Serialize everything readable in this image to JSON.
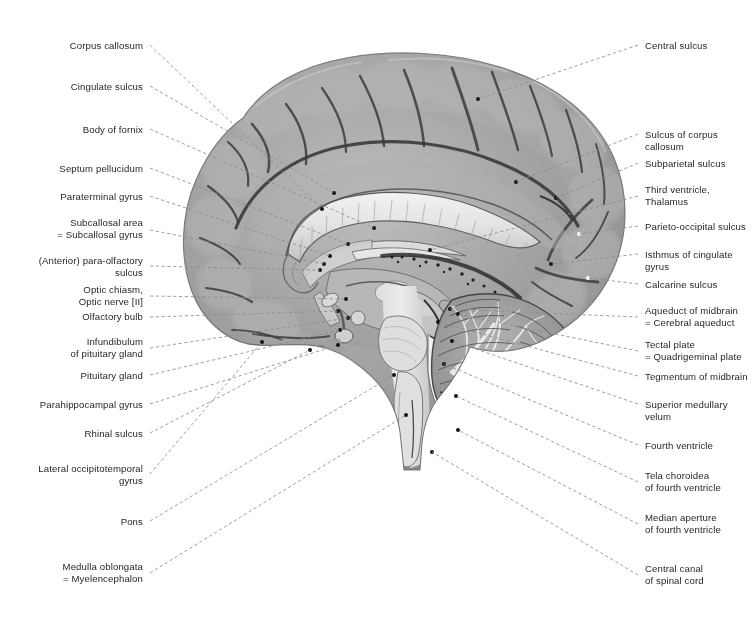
{
  "figure": {
    "background_color": "#ffffff",
    "leader_color": "#8d8d8d",
    "text_color": "#272727",
    "tissue_color": "#9a9a9a",
    "width": 752,
    "height": 643
  },
  "labels_left": [
    {
      "id": "corpus-callosum",
      "text": "Corpus callosum",
      "tx": 143,
      "ty": 47,
      "lx": 150,
      "ly": 45,
      "px": 322,
      "py": 209
    },
    {
      "id": "cingulate-sulcus",
      "text": "Cingulate sulcus",
      "tx": 143,
      "ty": 88,
      "lx": 150,
      "ly": 86,
      "px": 334,
      "py": 193
    },
    {
      "id": "body-of-fornix",
      "text": "Body of fornix",
      "tx": 143,
      "ty": 131,
      "lx": 150,
      "ly": 129,
      "px": 374,
      "py": 228
    },
    {
      "id": "septum-pellucidum",
      "text": "Septum pellucidum",
      "tx": 143,
      "ty": 170,
      "lx": 150,
      "ly": 168,
      "px": 348,
      "py": 244
    },
    {
      "id": "paraterminal-gyrus",
      "text": "Paraterminal gyrus",
      "tx": 143,
      "ty": 198,
      "lx": 150,
      "ly": 196,
      "px": 330,
      "py": 256
    },
    {
      "id": "subcallosal-area",
      "text": "Subcallosal area\n= Subcallosal gyrus",
      "tx": 143,
      "ty": 224,
      "lx": 150,
      "ly": 230,
      "px": 324,
      "py": 264
    },
    {
      "id": "anterior-para-olfactory-sulcus",
      "text": "(Anterior) para-olfactory\nsulcus",
      "tx": 143,
      "ty": 262,
      "lx": 150,
      "ly": 266,
      "px": 320,
      "py": 270
    },
    {
      "id": "optic-chiasm-optic-nerve",
      "text": "Optic chiasm,\nOptic nerve [II]",
      "tx": 143,
      "ty": 291,
      "lx": 150,
      "ly": 296,
      "px": 346,
      "py": 299
    },
    {
      "id": "olfactory-bulb",
      "text": "Olfactory bulb",
      "tx": 143,
      "ty": 318,
      "lx": 150,
      "ly": 317,
      "px": 338,
      "py": 311
    },
    {
      "id": "infundibulum",
      "text": "Infundibulum\nof pituitary gland",
      "tx": 143,
      "ty": 343,
      "lx": 150,
      "ly": 348,
      "px": 348,
      "py": 318
    },
    {
      "id": "pituitary-gland",
      "text": "Pituitary gland",
      "tx": 143,
      "ty": 377,
      "lx": 150,
      "ly": 375,
      "px": 340,
      "py": 330
    },
    {
      "id": "parahippocampal-gyrus",
      "text": "Parahippocampal gyrus",
      "tx": 143,
      "ty": 406,
      "lx": 150,
      "ly": 404,
      "px": 338,
      "py": 345
    },
    {
      "id": "rhinal-sulcus",
      "text": "Rhinal sulcus",
      "tx": 143,
      "ty": 435,
      "lx": 150,
      "ly": 433,
      "px": 310,
      "py": 350
    },
    {
      "id": "lateral-occipitotemporal-gyrus",
      "text": "Lateral occipitotemporal\ngyrus",
      "tx": 143,
      "ty": 470,
      "lx": 150,
      "ly": 474,
      "px": 262,
      "py": 342
    },
    {
      "id": "pons",
      "text": "Pons",
      "tx": 143,
      "ty": 523,
      "lx": 150,
      "ly": 521,
      "px": 394,
      "py": 375
    },
    {
      "id": "medulla-oblongata",
      "text": "Medulla oblongata\n= Myelencephalon",
      "tx": 143,
      "ty": 568,
      "lx": 150,
      "ly": 573,
      "px": 406,
      "py": 415
    }
  ],
  "labels_right": [
    {
      "id": "central-sulcus",
      "text": "Central sulcus",
      "tx": 645,
      "ty": 47,
      "lx": 638,
      "ly": 45,
      "px": 478,
      "py": 99
    },
    {
      "id": "sulcus-of-corpus-callosum",
      "text": "Sulcus of corpus callosum",
      "tx": 645,
      "ty": 136,
      "lx": 638,
      "ly": 134,
      "px": 516,
      "py": 182
    },
    {
      "id": "subparietal-sulcus",
      "text": "Subparietal sulcus",
      "tx": 645,
      "ty": 165,
      "lx": 638,
      "ly": 163,
      "px": 556,
      "py": 198
    },
    {
      "id": "third-ventricle-thalamus",
      "text": "Third ventricle,\nThalamus",
      "tx": 645,
      "ty": 191,
      "lx": 638,
      "ly": 196,
      "px": 430,
      "py": 250
    },
    {
      "id": "parieto-occipital-sulcus",
      "text": "Parieto-occipital sulcus",
      "tx": 645,
      "ty": 228,
      "lx": 638,
      "ly": 226,
      "px": 579,
      "py": 234
    },
    {
      "id": "isthmus-of-cingulate-gyrus",
      "text": "Isthmus of cingulate gyrus",
      "tx": 645,
      "ty": 256,
      "lx": 638,
      "ly": 254,
      "px": 551,
      "py": 264
    },
    {
      "id": "calcarine-sulcus",
      "text": "Calcarine sulcus",
      "tx": 645,
      "ty": 286,
      "lx": 638,
      "ly": 284,
      "px": 588,
      "py": 278
    },
    {
      "id": "aqueduct-of-midbrain",
      "text": "Aqueduct of midbrain\n= Cerebral aqueduct",
      "tx": 645,
      "ty": 312,
      "lx": 638,
      "ly": 317,
      "px": 450,
      "py": 309
    },
    {
      "id": "tectal-plate",
      "text": "Tectal plate\n= Quadrigeminal plate",
      "tx": 645,
      "ty": 346,
      "lx": 638,
      "ly": 351,
      "px": 458,
      "py": 314
    },
    {
      "id": "tegmentum-of-midbrain",
      "text": "Tegmentum of midbrain",
      "tx": 645,
      "ty": 378,
      "lx": 638,
      "ly": 376,
      "px": 438,
      "py": 322
    },
    {
      "id": "superior-medullary-velum",
      "text": "Superior medullary velum",
      "tx": 645,
      "ty": 406,
      "lx": 638,
      "ly": 404,
      "px": 452,
      "py": 341
    },
    {
      "id": "fourth-ventricle",
      "text": "Fourth ventricle",
      "tx": 645,
      "ty": 447,
      "lx": 638,
      "ly": 445,
      "px": 444,
      "py": 364
    },
    {
      "id": "tela-choroidea",
      "text": "Tela choroidea\nof fourth ventricle",
      "tx": 645,
      "ty": 477,
      "lx": 638,
      "ly": 482,
      "px": 456,
      "py": 396
    },
    {
      "id": "median-aperture",
      "text": "Median aperture\nof fourth ventricle",
      "tx": 645,
      "ty": 519,
      "lx": 638,
      "ly": 524,
      "px": 458,
      "py": 430
    },
    {
      "id": "central-canal",
      "text": "Central canal\nof spinal cord",
      "tx": 645,
      "ty": 570,
      "lx": 638,
      "ly": 575,
      "px": 432,
      "py": 452
    }
  ]
}
